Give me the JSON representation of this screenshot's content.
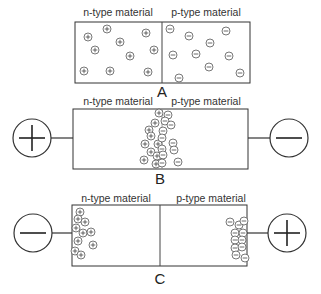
{
  "diagram": {
    "panels": [
      {
        "id": "A",
        "label": "A",
        "left_label": "n-type material",
        "right_label": "p-type material",
        "bias": "none",
        "left_terminal": null,
        "right_terminal": null,
        "n_carriers": "+",
        "p_carriers": "-"
      },
      {
        "id": "B",
        "label": "B",
        "left_label": "n-type material",
        "right_label": "p-type material",
        "bias": "forward",
        "left_terminal": "+",
        "right_terminal": "-",
        "n_carriers": "+",
        "p_carriers": "-"
      },
      {
        "id": "C",
        "label": "C",
        "left_label": "n-type material",
        "right_label": "p-type material",
        "bias": "reverse",
        "left_terminal": "-",
        "right_terminal": "+",
        "n_carriers": "+",
        "p_carriers": "-"
      }
    ]
  }
}
